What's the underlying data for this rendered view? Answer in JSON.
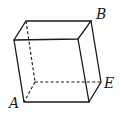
{
  "diagram": {
    "type": "parallelepiped",
    "colors": {
      "stroke": "#1a1a1a",
      "background": "#ffffff"
    },
    "vertices": {
      "front_top_left": [
        14,
        40
      ],
      "front_top_right": [
        78,
        39
      ],
      "back_top_left": [
        26,
        21
      ],
      "back_top_right": [
        91,
        21
      ],
      "front_bottom_left": [
        24,
        102
      ],
      "front_bottom_right": [
        89,
        102
      ],
      "back_bottom_left": [
        35,
        82
      ],
      "back_bottom_right": [
        101,
        82
      ]
    },
    "labels": [
      {
        "text": "B",
        "x": 96,
        "y": 19,
        "vertex": "back_top_right"
      },
      {
        "text": "E",
        "x": 104,
        "y": 88,
        "vertex": "back_bottom_right"
      },
      {
        "text": "A",
        "x": 9,
        "y": 108,
        "vertex": "front_bottom_left"
      }
    ]
  }
}
